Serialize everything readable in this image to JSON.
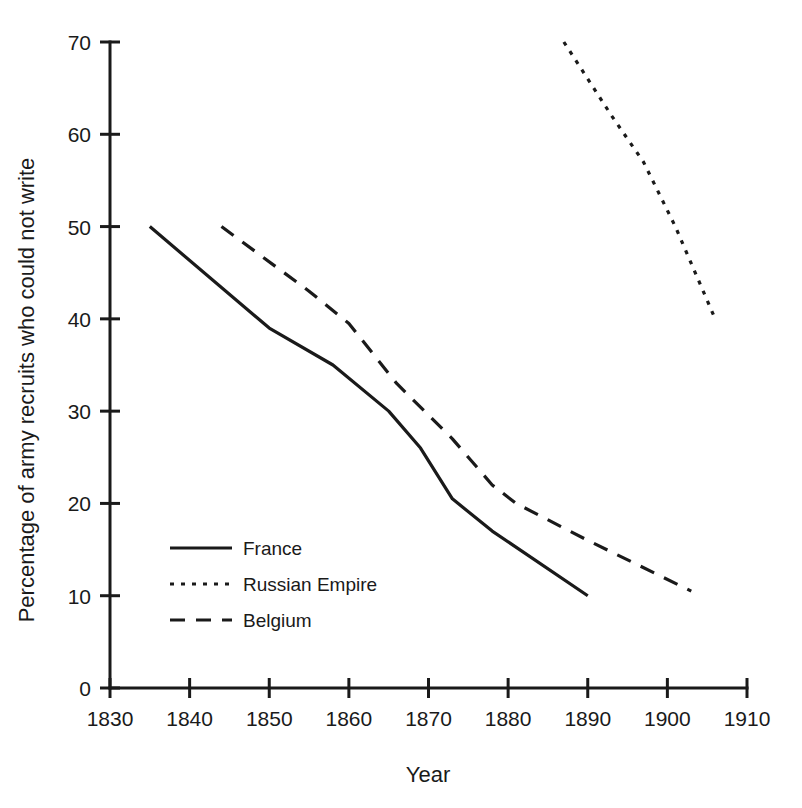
{
  "chart_data": {
    "type": "line",
    "title": "",
    "xlabel": "Year",
    "ylabel": "Percentage of army recruits who could not write",
    "xlim": [
      1830,
      1910
    ],
    "ylim": [
      0,
      70
    ],
    "xticks": [
      1830,
      1840,
      1850,
      1860,
      1870,
      1880,
      1890,
      1900,
      1910
    ],
    "yticks": [
      0,
      10,
      20,
      30,
      40,
      50,
      60,
      70
    ],
    "xtick_labels": [
      "1830",
      "1840",
      "1850",
      "1860",
      "1870",
      "1880",
      "1890",
      "1900",
      "1910"
    ],
    "ytick_labels": [
      "0",
      "10",
      "20",
      "30",
      "40",
      "50",
      "60",
      "70"
    ],
    "grid": false,
    "legend_position": "inside-lower-left",
    "series": [
      {
        "name": "France",
        "style": "solid",
        "points": [
          [
            1835,
            50
          ],
          [
            1850,
            39
          ],
          [
            1858,
            35
          ],
          [
            1865,
            30
          ],
          [
            1869,
            26
          ],
          [
            1873,
            20.5
          ],
          [
            1878,
            17
          ],
          [
            1890,
            10
          ]
        ]
      },
      {
        "name": "Russian Empire",
        "style": "dotted",
        "points": [
          [
            1887,
            70
          ],
          [
            1893,
            62
          ],
          [
            1897,
            57
          ],
          [
            1901,
            50
          ],
          [
            1906,
            40
          ]
        ]
      },
      {
        "name": "Belgium",
        "style": "dashed",
        "points": [
          [
            1844,
            50
          ],
          [
            1855,
            43
          ],
          [
            1860,
            39.5
          ],
          [
            1866,
            33
          ],
          [
            1873,
            27
          ],
          [
            1878,
            22
          ],
          [
            1881,
            20
          ],
          [
            1890,
            16
          ],
          [
            1903,
            10.5
          ]
        ]
      }
    ]
  },
  "legend": {
    "entries": [
      {
        "label": "France"
      },
      {
        "label": "Russian Empire"
      },
      {
        "label": "Belgium"
      }
    ]
  },
  "axes": {
    "x_title": "Year",
    "y_title": "Percentage of army recruits who could not write"
  }
}
